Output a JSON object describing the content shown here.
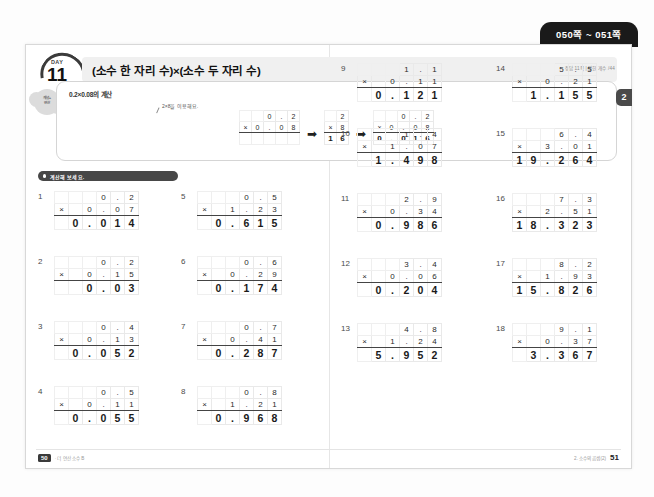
{
  "page_range_tab": "050쪽 ~ 051쪽",
  "side_tab": "2",
  "header": {
    "day_label": "DAY",
    "day_number": "11",
    "title": "(소수 한 자리 수)×(소수 두 자리 수)",
    "meta": "정답 11쪽 | 맞힌 개수    /44"
  },
  "concept_badge": "개념+\n연산",
  "example": {
    "title": "0.2×0.08의 계산",
    "callout": "2×8을 이용해요.",
    "arrow": "➡",
    "steps": [
      {
        "top": "0.2",
        "bottom": "0.08",
        "product": ""
      },
      {
        "top": "2",
        "bottom": "8",
        "product": "16"
      },
      {
        "top": "0.2",
        "bottom": "0.08",
        "product": "0.016"
      }
    ]
  },
  "instruction": "계산해 보세요.",
  "multiply_sign": "×",
  "problems": [
    {
      "n": "1",
      "a": "0.2",
      "b": "0.07",
      "ans": "0.014"
    },
    {
      "n": "2",
      "a": "0.2",
      "b": "0.15",
      "ans": "0.03"
    },
    {
      "n": "3",
      "a": "0.4",
      "b": "0.13",
      "ans": "0.052"
    },
    {
      "n": "4",
      "a": "0.5",
      "b": "0.11",
      "ans": "0.055"
    },
    {
      "n": "5",
      "a": "0.5",
      "b": "1.23",
      "ans": "0.615"
    },
    {
      "n": "6",
      "a": "0.6",
      "b": "0.29",
      "ans": "0.174"
    },
    {
      "n": "7",
      "a": "0.7",
      "b": "0.41",
      "ans": "0.287"
    },
    {
      "n": "8",
      "a": "0.8",
      "b": "1.21",
      "ans": "0.968"
    },
    {
      "n": "9",
      "a": "1.1",
      "b": "0.11",
      "ans": "0.121"
    },
    {
      "n": "10",
      "a": "1.4",
      "b": "1.07",
      "ans": "1.498"
    },
    {
      "n": "11",
      "a": "2.9",
      "b": "0.34",
      "ans": "0.986"
    },
    {
      "n": "12",
      "a": "3.4",
      "b": "0.06",
      "ans": "0.204"
    },
    {
      "n": "13",
      "a": "4.8",
      "b": "1.24",
      "ans": "5.952"
    },
    {
      "n": "14",
      "a": "5.5",
      "b": "0.21",
      "ans": "1.155"
    },
    {
      "n": "15",
      "a": "6.4",
      "b": "3.01",
      "ans": "19.264"
    },
    {
      "n": "16",
      "a": "7.3",
      "b": "2.51",
      "ans": "18.323"
    },
    {
      "n": "17",
      "a": "8.2",
      "b": "1.93",
      "ans": "15.826"
    },
    {
      "n": "18",
      "a": "9.1",
      "b": "0.37",
      "ans": "3.367"
    }
  ],
  "footer": {
    "left_page": "50",
    "left_text": "· 더 연산 소수 B",
    "right_text": "2. 소수의 곱셈(2)",
    "right_page": "51"
  }
}
